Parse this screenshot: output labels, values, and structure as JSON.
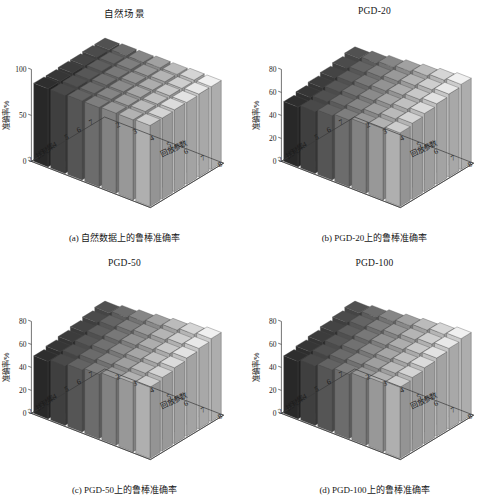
{
  "figure": {
    "background": "#ffffff",
    "layout": "2x2 grid of 3D bar charts"
  },
  "panels": [
    {
      "key": "a",
      "title": "自然场景",
      "caption": "(a) 自然数据上的鲁棒准确率",
      "ylabel": "准确率/%",
      "xlabel": "回放参数",
      "zlabel": "扰动集",
      "yticks": [
        "0",
        "50",
        "100"
      ],
      "xticks": [
        "2",
        "3",
        "4",
        "5",
        "6",
        "7",
        "8"
      ],
      "zticks": [
        "2",
        "3",
        "4",
        "5",
        "6",
        "7"
      ]
    },
    {
      "key": "b",
      "title": "PGD-20",
      "caption": "(b) PGD-20上的鲁棒准确率",
      "ylabel": "准确率/%",
      "xlabel": "回放参数",
      "zlabel": "扰动集",
      "yticks": [
        "0",
        "20",
        "40",
        "60",
        "80"
      ],
      "xticks": [
        "2",
        "3",
        "4",
        "5",
        "6",
        "7",
        "8"
      ],
      "zticks": [
        "2",
        "3",
        "4",
        "5",
        "6",
        "7"
      ]
    },
    {
      "key": "c",
      "title": "PGD-50",
      "caption": "(c) PGD-50上的鲁棒准确率",
      "ylabel": "准确率/%",
      "xlabel": "回放参数",
      "zlabel": "扰动集",
      "yticks": [
        "0",
        "20",
        "40",
        "60",
        "80"
      ],
      "xticks": [
        "2",
        "3",
        "4",
        "5",
        "6",
        "7",
        "8"
      ],
      "zticks": [
        "2",
        "3",
        "4",
        "5",
        "6",
        "7"
      ]
    },
    {
      "key": "d",
      "title": "PGD-100",
      "caption": "(d) PGD-100上的鲁棒准确率",
      "ylabel": "准确率/%",
      "xlabel": "回放参数",
      "zlabel": "扰动集",
      "yticks": [
        "0",
        "20",
        "40",
        "60",
        "80"
      ],
      "xticks": [
        "2",
        "3",
        "4",
        "5",
        "6",
        "7",
        "8"
      ],
      "zticks": [
        "2",
        "3",
        "4",
        "5",
        "6",
        "7"
      ]
    }
  ],
  "colors": {
    "axis": "#3a3a3a",
    "text": "#1a1a1a",
    "floor": "#fdfdfd",
    "bar_dark": "#2b2b2b",
    "bar_light": "#dcdcdc"
  },
  "chart_data": [
    {
      "type": "bar",
      "subtype": "bar3-surface",
      "panel": "a",
      "title": "自然场景",
      "xlabel": "回放参数",
      "ylabel": "准确率/%",
      "zlabel": "扰动集",
      "x": [
        2,
        3,
        4,
        5,
        6,
        7,
        8
      ],
      "z": [
        2,
        3,
        4,
        5,
        6,
        7
      ],
      "ylim": [
        0,
        100
      ],
      "yticks": [
        0,
        50,
        100
      ],
      "grid": false,
      "legend": "none",
      "series": [
        {
          "name": "扰动集=2",
          "values": [
            85,
            85,
            86,
            86,
            87,
            87,
            88
          ]
        },
        {
          "name": "扰动集=3",
          "values": [
            85,
            86,
            86,
            87,
            87,
            88,
            88
          ]
        },
        {
          "name": "扰动集=4",
          "values": [
            86,
            86,
            87,
            87,
            88,
            88,
            89
          ]
        },
        {
          "name": "扰动集=5",
          "values": [
            86,
            87,
            87,
            88,
            88,
            89,
            89
          ]
        },
        {
          "name": "扰动集=6",
          "values": [
            87,
            87,
            88,
            88,
            89,
            89,
            90
          ]
        },
        {
          "name": "扰动集=7",
          "values": [
            87,
            88,
            88,
            89,
            89,
            90,
            90
          ]
        }
      ]
    },
    {
      "type": "bar",
      "subtype": "bar3-surface",
      "panel": "b",
      "title": "PGD-20",
      "xlabel": "回放参数",
      "ylabel": "准确率/%",
      "zlabel": "扰动集",
      "x": [
        2,
        3,
        4,
        5,
        6,
        7,
        8
      ],
      "z": [
        2,
        3,
        4,
        5,
        6,
        7
      ],
      "ylim": [
        0,
        80
      ],
      "yticks": [
        0,
        20,
        40,
        60,
        80
      ],
      "grid": false,
      "legend": "none",
      "series": [
        {
          "name": "扰动集=2",
          "values": [
            52,
            54,
            56,
            58,
            60,
            62,
            64
          ]
        },
        {
          "name": "扰动集=3",
          "values": [
            54,
            56,
            58,
            60,
            62,
            64,
            66
          ]
        },
        {
          "name": "扰动集=4",
          "values": [
            56,
            58,
            60,
            62,
            64,
            66,
            68
          ]
        },
        {
          "name": "扰动集=5",
          "values": [
            58,
            60,
            62,
            64,
            66,
            68,
            70
          ]
        },
        {
          "name": "扰动集=6",
          "values": [
            60,
            62,
            64,
            66,
            68,
            70,
            72
          ]
        },
        {
          "name": "扰动集=7",
          "values": [
            62,
            64,
            66,
            68,
            70,
            72,
            74
          ]
        }
      ]
    },
    {
      "type": "bar",
      "subtype": "bar3-surface",
      "panel": "c",
      "title": "PGD-50",
      "xlabel": "回放参数",
      "ylabel": "准确率/%",
      "zlabel": "扰动集",
      "x": [
        2,
        3,
        4,
        5,
        6,
        7,
        8
      ],
      "z": [
        2,
        3,
        4,
        5,
        6,
        7
      ],
      "ylim": [
        0,
        80
      ],
      "yticks": [
        0,
        20,
        40,
        60,
        80
      ],
      "grid": false,
      "legend": "none",
      "series": [
        {
          "name": "扰动集=2",
          "values": [
            50,
            52,
            54,
            56,
            58,
            60,
            62
          ]
        },
        {
          "name": "扰动集=3",
          "values": [
            52,
            54,
            56,
            58,
            60,
            62,
            64
          ]
        },
        {
          "name": "扰动集=4",
          "values": [
            54,
            56,
            58,
            60,
            62,
            64,
            66
          ]
        },
        {
          "name": "扰动集=5",
          "values": [
            56,
            58,
            60,
            62,
            64,
            66,
            68
          ]
        },
        {
          "name": "扰动集=6",
          "values": [
            58,
            60,
            62,
            64,
            66,
            68,
            70
          ]
        },
        {
          "name": "扰动集=7",
          "values": [
            60,
            62,
            64,
            66,
            68,
            70,
            72
          ]
        }
      ]
    },
    {
      "type": "bar",
      "subtype": "bar3-surface",
      "panel": "d",
      "title": "PGD-100",
      "xlabel": "回放参数",
      "ylabel": "准确率/%",
      "zlabel": "扰动集",
      "x": [
        2,
        3,
        4,
        5,
        6,
        7,
        8
      ],
      "z": [
        2,
        3,
        4,
        5,
        6,
        7
      ],
      "ylim": [
        0,
        80
      ],
      "yticks": [
        0,
        20,
        40,
        60,
        80
      ],
      "grid": false,
      "legend": "none",
      "series": [
        {
          "name": "扰动集=2",
          "values": [
            50,
            52,
            54,
            56,
            58,
            60,
            62
          ]
        },
        {
          "name": "扰动集=3",
          "values": [
            52,
            54,
            56,
            58,
            60,
            62,
            64
          ]
        },
        {
          "name": "扰动集=4",
          "values": [
            54,
            56,
            58,
            60,
            62,
            64,
            66
          ]
        },
        {
          "name": "扰动集=5",
          "values": [
            56,
            58,
            60,
            62,
            64,
            66,
            68
          ]
        },
        {
          "name": "扰动集=6",
          "values": [
            58,
            60,
            62,
            64,
            66,
            68,
            70
          ]
        },
        {
          "name": "扰动集=7",
          "values": [
            60,
            62,
            64,
            66,
            68,
            70,
            72
          ]
        }
      ]
    }
  ]
}
